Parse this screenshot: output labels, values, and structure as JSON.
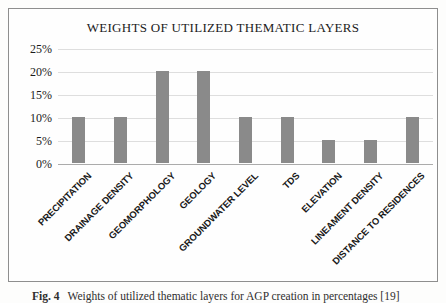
{
  "figure": {
    "caption_label": "Fig. 4",
    "caption_text": "Weights of utilized thematic layers for AGP creation in percentages [19]"
  },
  "chart_data": {
    "type": "bar",
    "title": "WEIGHTS OF UTILIZED THEMATIC LAYERS",
    "categories": [
      "PRECIPITATION",
      "DRAINAGE DENSITY",
      "GEOMORPHOLOGY",
      "GEOLOGY",
      "GROUNDWATER LEVEL",
      "TDS",
      "ELEVATION",
      "LINEAMENT DENSITY",
      "DISTANCE TO RESIDENCES"
    ],
    "values": [
      10,
      10,
      20,
      20,
      10,
      10,
      5,
      5,
      10
    ],
    "unit": "%",
    "ylim": [
      0,
      25
    ],
    "yticks": [
      0,
      5,
      10,
      15,
      20,
      25
    ],
    "ytick_labels": [
      "0%",
      "5%",
      "10%",
      "15%",
      "20%",
      "25%"
    ],
    "xlabel": "",
    "ylabel": "",
    "grid": true,
    "legend_position": "none",
    "bar_color": "#8a8a8a",
    "gridline_color": "#dedede",
    "axis_line_color": "#ababab"
  },
  "colors": {
    "frame_border": "#8e8e8e",
    "background": "#fdfdfc",
    "text": "#1c1c1c"
  }
}
